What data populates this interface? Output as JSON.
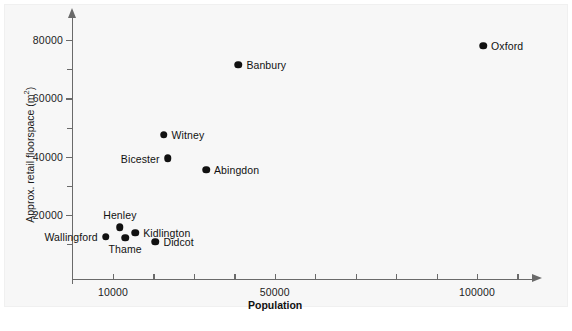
{
  "chart_data": {
    "type": "scatter",
    "title": "",
    "xlabel": "Population",
    "ylabel": "Approx. retail floorspace (m²)",
    "ylabel_main": "Approx. retail floorspace (m",
    "ylabel_sup": "2",
    "ylabel_close": ")",
    "xlim": [
      7000,
      113000
    ],
    "ylim": [
      0,
      86000
    ],
    "grid": false,
    "legend": "none",
    "xticks": [
      {
        "value": 10000,
        "label": "10000",
        "major": true
      },
      {
        "value": 20000,
        "label": "",
        "major": false
      },
      {
        "value": 30000,
        "label": "",
        "major": false
      },
      {
        "value": 40000,
        "label": "",
        "major": false
      },
      {
        "value": 50000,
        "label": "50000",
        "major": true
      },
      {
        "value": 60000,
        "label": "",
        "major": false
      },
      {
        "value": 70000,
        "label": "",
        "major": false
      },
      {
        "value": 80000,
        "label": "",
        "major": false
      },
      {
        "value": 90000,
        "label": "",
        "major": false
      },
      {
        "value": 100000,
        "label": "100000",
        "major": true
      },
      {
        "value": 110000,
        "label": "",
        "major": false
      }
    ],
    "yticks": [
      {
        "value": 10000,
        "label": "",
        "major": false
      },
      {
        "value": 20000,
        "label": "20000",
        "major": true
      },
      {
        "value": 30000,
        "label": "",
        "major": false
      },
      {
        "value": 40000,
        "label": "40000",
        "major": true
      },
      {
        "value": 50000,
        "label": "",
        "major": false
      },
      {
        "value": 60000,
        "label": "60000",
        "major": true
      },
      {
        "value": 70000,
        "label": "",
        "major": false
      },
      {
        "value": 80000,
        "label": "80000",
        "major": true
      }
    ],
    "points": [
      {
        "name": "Oxford",
        "x": 101500,
        "y": 78000,
        "label_pos": "right"
      },
      {
        "name": "Banbury",
        "x": 41000,
        "y": 71500,
        "label_pos": "right"
      },
      {
        "name": "Witney",
        "x": 22500,
        "y": 47500,
        "label_pos": "right"
      },
      {
        "name": "Bicester",
        "x": 23500,
        "y": 39500,
        "label_pos": "left"
      },
      {
        "name": "Abingdon",
        "x": 33000,
        "y": 35500,
        "label_pos": "right"
      },
      {
        "name": "Henley",
        "x": 11700,
        "y": 15800,
        "label_pos": "above"
      },
      {
        "name": "Kidlington",
        "x": 15500,
        "y": 13900,
        "label_pos": "right"
      },
      {
        "name": "Thame",
        "x": 13000,
        "y": 12200,
        "label_pos": "below"
      },
      {
        "name": "Wallingford",
        "x": 8200,
        "y": 12500,
        "label_pos": "left"
      },
      {
        "name": "Didcot",
        "x": 20500,
        "y": 10800,
        "label_pos": "right"
      }
    ]
  },
  "caption": ""
}
